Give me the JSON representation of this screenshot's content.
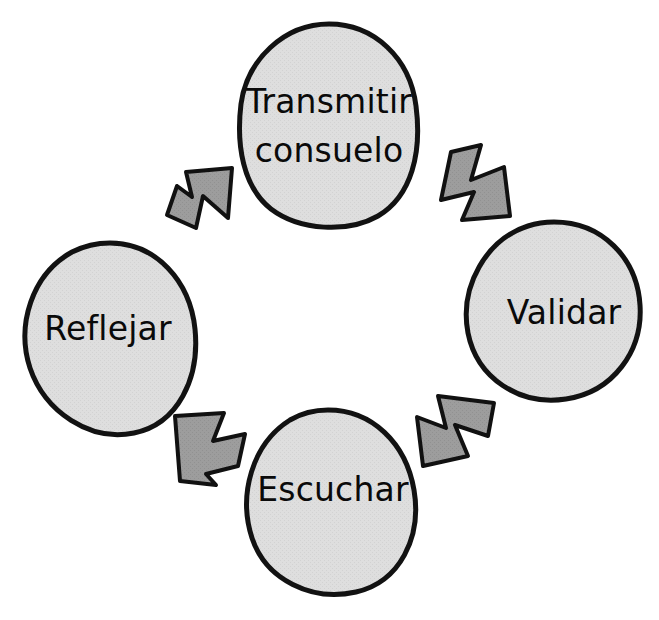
{
  "diagram": {
    "type": "cycle",
    "direction": "clockwise",
    "background_color": "#ffffff",
    "node_fill": "#dcdcdc",
    "node_stroke": "#121212",
    "arrow_fill": "#9a9a9a",
    "arrow_stroke": "#111111",
    "text_color": "#0a0a0a",
    "nodes": [
      {
        "id": "transmitir-consuelo",
        "position": "top",
        "shape": "ellipse",
        "lines": [
          "Transmitir",
          "consuelo"
        ],
        "label": "Transmitir consuelo"
      },
      {
        "id": "validar",
        "position": "right",
        "shape": "ellipse",
        "lines": [
          "Validar"
        ],
        "label": "Validar"
      },
      {
        "id": "escuchar",
        "position": "bottom",
        "shape": "ellipse",
        "lines": [
          "Escuchar"
        ],
        "label": "Escuchar"
      },
      {
        "id": "reflejar",
        "position": "left",
        "shape": "ellipse",
        "lines": [
          "Reflejar"
        ],
        "label": "Reflejar"
      }
    ],
    "arrows": [
      {
        "id": "arrow-transmitir-to-validar",
        "from": "transmitir-consuelo",
        "to": "validar",
        "direction": "down-right",
        "position": "top-right"
      },
      {
        "id": "arrow-validar-to-escuchar",
        "from": "validar",
        "to": "escuchar",
        "direction": "down-left",
        "position": "bottom-right"
      },
      {
        "id": "arrow-escuchar-to-reflejar",
        "from": "escuchar",
        "to": "reflejar",
        "direction": "up-left",
        "position": "bottom-left"
      },
      {
        "id": "arrow-reflejar-to-transmitir",
        "from": "reflejar",
        "to": "transmitir-consuelo",
        "direction": "up-right",
        "position": "top-left"
      }
    ]
  }
}
